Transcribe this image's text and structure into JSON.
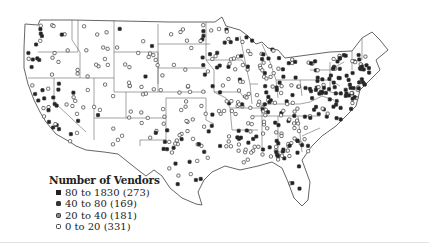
{
  "legend": {
    "title": "Number of Vendors",
    "items": [
      {
        "label": "80 to 1830 (273)",
        "range": "80 to 1830",
        "count": 273,
        "symbol": "filled-square",
        "color": "#222222"
      },
      {
        "label": "40 to 80 (169)",
        "range": "40 to 80",
        "count": 169,
        "symbol": "filled-dot",
        "color": "#333333"
      },
      {
        "label": "20 to 40 (181)",
        "range": "20 to 40",
        "count": 181,
        "symbol": "gray-dot",
        "color": "#888888"
      },
      {
        "label": "0 to 20 (331)",
        "range": "0 to 20",
        "count": 331,
        "symbol": "open-square",
        "color": "#ffffff"
      }
    ]
  },
  "map": {
    "region": "Contiguous United States",
    "boundaries": "state outlines",
    "colors": {
      "outline": "#555555",
      "background": "#ffffff",
      "high": "#222222",
      "open": "#ffffff"
    }
  }
}
